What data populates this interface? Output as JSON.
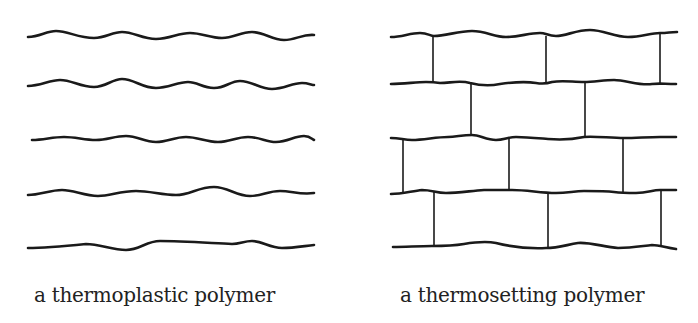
{
  "panels": [
    {
      "id": "thermoplastic",
      "caption": "a thermoplastic polymer",
      "description": "Five independent wavy polymer chains with no crosslinks",
      "chain_count": 5,
      "crosslinks": 0
    },
    {
      "id": "thermosetting",
      "caption": "a thermosetting polymer",
      "description": "Five wavy polymer chains joined by vertical crosslinks in a brick-like pattern",
      "chain_count": 5,
      "crosslinks": 11
    }
  ],
  "colors": {
    "line": "#1a1a1a",
    "background": "#ffffff",
    "text": "#222222"
  }
}
